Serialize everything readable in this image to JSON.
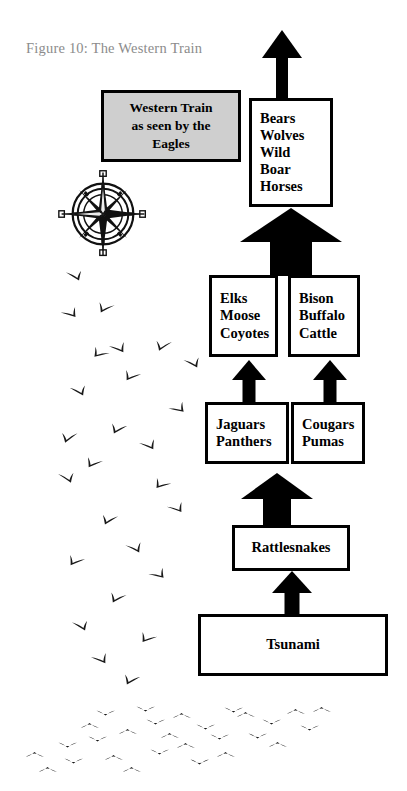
{
  "figure": {
    "caption": "Figure 10: The Western Train",
    "caption_color": "#8c8c8c",
    "background": "#ffffff",
    "ink_color": "#000000"
  },
  "title_box": {
    "fill": "#cfcfcf",
    "lines": [
      "Western Train",
      "as seen by the",
      "Eagles"
    ]
  },
  "nodes": {
    "top": {
      "lines": [
        "Bears",
        "Wolves",
        "Wild",
        "Boar",
        "Horses"
      ]
    },
    "elks": {
      "lines": [
        "Elks",
        "Moose",
        "Coyotes"
      ]
    },
    "bison": {
      "lines": [
        "Bison",
        "Buffalo",
        "Cattle"
      ]
    },
    "jaguars": {
      "lines": [
        "Jaguars",
        "Panthers"
      ]
    },
    "cougars": {
      "lines": [
        "Cougars",
        "Pumas"
      ]
    },
    "rattlesnakes": {
      "lines": [
        "Rattlesnakes"
      ]
    },
    "tsunami": {
      "lines": [
        "Tsunami"
      ]
    }
  },
  "compass": {
    "labels": {
      "north": "N",
      "south": "S",
      "east": "E",
      "west": "W"
    }
  },
  "chart_data": {
    "type": "diagram",
    "title": "Figure 10: The Western Train",
    "subtitle": "Western Train as seen by the Eagles",
    "layout": "bottom-up hierarchy with two parallel mid branches",
    "nodes": [
      {
        "id": "tsunami",
        "label": "Tsunami",
        "level": 1
      },
      {
        "id": "rattlesnakes",
        "label": "Rattlesnakes",
        "level": 2
      },
      {
        "id": "jaguars",
        "label": "Jaguars Panthers",
        "level": 3
      },
      {
        "id": "cougars",
        "label": "Cougars Pumas",
        "level": 3
      },
      {
        "id": "elks",
        "label": "Elks Moose Coyotes",
        "level": 4
      },
      {
        "id": "bison",
        "label": "Bison Buffalo Cattle",
        "level": 4
      },
      {
        "id": "top",
        "label": "Bears Wolves Wild Boar Horses",
        "level": 5
      }
    ],
    "edges": [
      {
        "from": "tsunami",
        "to": "rattlesnakes"
      },
      {
        "from": "rattlesnakes",
        "to": "jaguars"
      },
      {
        "from": "rattlesnakes",
        "to": "cougars"
      },
      {
        "from": "jaguars",
        "to": "elks"
      },
      {
        "from": "cougars",
        "to": "bison"
      },
      {
        "from": "elks",
        "to": "top"
      },
      {
        "from": "bison",
        "to": "top"
      },
      {
        "from": "top",
        "to": "outward"
      }
    ]
  }
}
